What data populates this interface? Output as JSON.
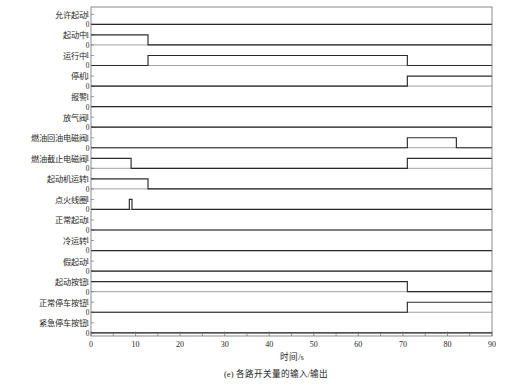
{
  "caption": "(e)  各路开关量的输入/输出",
  "axis": {
    "xlabel": "时间/s",
    "xticks": [
      0,
      10,
      20,
      30,
      40,
      50,
      60,
      70,
      80,
      90
    ],
    "xlim": [
      0,
      90
    ],
    "ylevels": [
      "1",
      "0"
    ]
  },
  "colors": {
    "signal": "#2b2b2b",
    "baseline": "#7a7a7a",
    "frame": "#6e6e6e",
    "text": "#262626",
    "background": "#ffffff"
  },
  "chart_data": {
    "type": "line",
    "title": "",
    "subtitle": "",
    "xlabel": "时间/s",
    "ylabel": "",
    "xlim": [
      0,
      90
    ],
    "ylim": [
      0,
      1
    ],
    "grid": false,
    "legend": "none",
    "signal_count": 16,
    "series": [
      {
        "name": "允许起动",
        "index": 0,
        "values": [
          0,
          0
        ],
        "x": [
          0,
          90
        ],
        "transitions": [],
        "steps": [
          [
            0,
            0
          ],
          [
            90,
            0
          ]
        ]
      },
      {
        "name": "起动中",
        "index": 1,
        "values": [
          1,
          1,
          0,
          0
        ],
        "x": [
          0,
          12.8,
          12.8,
          90
        ],
        "transitions": [
          {
            "t": 12.8,
            "from": 1,
            "to": 0
          }
        ],
        "steps": [
          [
            0,
            1
          ],
          [
            12.8,
            1
          ],
          [
            12.8,
            0
          ],
          [
            90,
            0
          ]
        ]
      },
      {
        "name": "运行中",
        "index": 2,
        "values": [
          0,
          0,
          1,
          1,
          0,
          0
        ],
        "x": [
          0,
          12.8,
          12.8,
          71,
          71,
          90
        ],
        "transitions": [
          {
            "t": 12.8,
            "from": 0,
            "to": 1
          },
          {
            "t": 71,
            "from": 1,
            "to": 0
          }
        ],
        "steps": [
          [
            0,
            0
          ],
          [
            12.8,
            0
          ],
          [
            12.8,
            1
          ],
          [
            71,
            1
          ],
          [
            71,
            0
          ],
          [
            90,
            0
          ]
        ]
      },
      {
        "name": "停机",
        "index": 3,
        "values": [
          0,
          0,
          1,
          1
        ],
        "x": [
          0,
          71,
          71,
          90
        ],
        "transitions": [
          {
            "t": 71,
            "from": 0,
            "to": 1
          }
        ],
        "steps": [
          [
            0,
            0
          ],
          [
            71,
            0
          ],
          [
            71,
            1
          ],
          [
            90,
            1
          ]
        ]
      },
      {
        "name": "报警",
        "index": 4,
        "values": [
          0,
          0
        ],
        "x": [
          0,
          90
        ],
        "transitions": [],
        "steps": [
          [
            0,
            0
          ],
          [
            90,
            0
          ]
        ]
      },
      {
        "name": "放气阀",
        "index": 5,
        "values": [
          0,
          0
        ],
        "x": [
          0,
          90
        ],
        "transitions": [],
        "steps": [
          [
            0,
            0
          ],
          [
            90,
            0
          ]
        ]
      },
      {
        "name": "燃油回油电磁阀",
        "index": 6,
        "values": [
          0,
          0,
          1,
          1,
          0,
          0
        ],
        "x": [
          0,
          71,
          71,
          82,
          82,
          90
        ],
        "transitions": [
          {
            "t": 71,
            "from": 0,
            "to": 1
          },
          {
            "t": 82,
            "from": 1,
            "to": 0
          }
        ],
        "steps": [
          [
            0,
            0
          ],
          [
            71,
            0
          ],
          [
            71,
            1
          ],
          [
            82,
            1
          ],
          [
            82,
            0
          ],
          [
            90,
            0
          ]
        ]
      },
      {
        "name": "燃油截止电磁阀",
        "index": 7,
        "values": [
          1,
          1,
          0,
          0,
          1,
          1
        ],
        "x": [
          0,
          9,
          9,
          71,
          71,
          90
        ],
        "transitions": [
          {
            "t": 9,
            "from": 1,
            "to": 0
          },
          {
            "t": 71,
            "from": 0,
            "to": 1
          }
        ],
        "steps": [
          [
            0,
            1
          ],
          [
            9,
            1
          ],
          [
            9,
            0
          ],
          [
            71,
            0
          ],
          [
            71,
            1
          ],
          [
            90,
            1
          ]
        ]
      },
      {
        "name": "起动机运转",
        "index": 8,
        "values": [
          1,
          1,
          0,
          0
        ],
        "x": [
          0,
          12.8,
          12.8,
          90
        ],
        "transitions": [
          {
            "t": 12.8,
            "from": 1,
            "to": 0
          }
        ],
        "steps": [
          [
            0,
            1
          ],
          [
            12.8,
            1
          ],
          [
            12.8,
            0
          ],
          [
            90,
            0
          ]
        ]
      },
      {
        "name": "点火线圈",
        "index": 9,
        "values": [
          0,
          0,
          1,
          1,
          0,
          0
        ],
        "x": [
          0,
          8.6,
          8.6,
          9.2,
          9.2,
          90
        ],
        "transitions": [
          {
            "t": 8.6,
            "from": 0,
            "to": 1
          },
          {
            "t": 9.2,
            "from": 1,
            "to": 0
          }
        ],
        "steps": [
          [
            0,
            0
          ],
          [
            8.6,
            0
          ],
          [
            8.6,
            1
          ],
          [
            9.2,
            1
          ],
          [
            9.2,
            0
          ],
          [
            90,
            0
          ]
        ]
      },
      {
        "name": "正常起动",
        "index": 10,
        "values": [
          0,
          0
        ],
        "x": [
          0,
          90
        ],
        "transitions": [],
        "steps": [
          [
            0,
            0
          ],
          [
            90,
            0
          ]
        ]
      },
      {
        "name": "冷运转",
        "index": 11,
        "values": [
          0,
          0
        ],
        "x": [
          0,
          90
        ],
        "transitions": [],
        "steps": [
          [
            0,
            0
          ],
          [
            90,
            0
          ]
        ]
      },
      {
        "name": "假起动",
        "index": 12,
        "values": [
          0,
          0
        ],
        "x": [
          0,
          90
        ],
        "transitions": [],
        "steps": [
          [
            0,
            0
          ],
          [
            90,
            0
          ]
        ]
      },
      {
        "name": "起动按钮",
        "index": 13,
        "values": [
          1,
          1,
          0,
          0
        ],
        "x": [
          0,
          71,
          71,
          90
        ],
        "transitions": [
          {
            "t": 71,
            "from": 1,
            "to": 0
          }
        ],
        "steps": [
          [
            0,
            1
          ],
          [
            71,
            1
          ],
          [
            71,
            0
          ],
          [
            90,
            0
          ]
        ]
      },
      {
        "name": "正常停车按钮",
        "index": 14,
        "values": [
          0,
          0,
          1,
          1
        ],
        "x": [
          0,
          71,
          71,
          90
        ],
        "transitions": [
          {
            "t": 71,
            "from": 0,
            "to": 1
          }
        ],
        "steps": [
          [
            0,
            0
          ],
          [
            71,
            0
          ],
          [
            71,
            1
          ],
          [
            90,
            1
          ]
        ]
      },
      {
        "name": "紧急停车按钮",
        "index": 15,
        "values": [
          0,
          0
        ],
        "x": [
          0,
          90
        ],
        "transitions": [],
        "steps": [
          [
            0,
            0
          ],
          [
            90,
            0
          ]
        ]
      }
    ]
  }
}
